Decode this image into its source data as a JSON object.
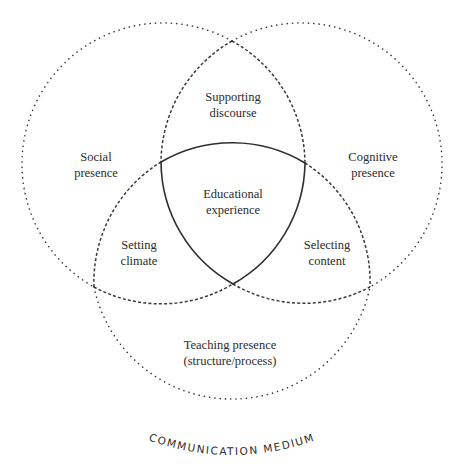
{
  "diagram": {
    "circles": {
      "social": {
        "label_line1": "Social",
        "label_line2": "presence"
      },
      "cognitive": {
        "label_line1": "Cognitive",
        "label_line2": "presence"
      },
      "teaching": {
        "label_line1": "Teaching presence",
        "label_line2": "(structure/process)"
      }
    },
    "overlaps": {
      "social_cognitive": {
        "label_line1": "Supporting",
        "label_line2": "discourse"
      },
      "social_teaching": {
        "label_line1": "Setting",
        "label_line2": "climate"
      },
      "cognitive_teaching": {
        "label_line1": "Selecting",
        "label_line2": "content"
      },
      "center": {
        "label_line1": "Educational",
        "label_line2": "experience"
      }
    },
    "outer_caption": "COMMUNICATION MEDIUM",
    "colors": {
      "line": "#3a3a3a",
      "background": "#ffffff",
      "text": "#2b2b2b"
    }
  }
}
